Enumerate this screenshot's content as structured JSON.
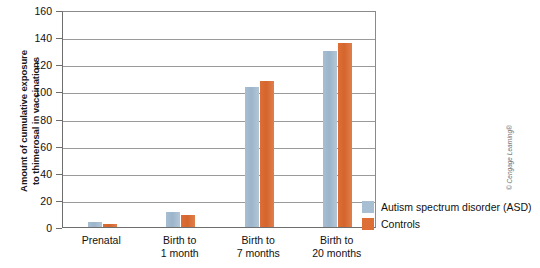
{
  "chart_data": {
    "type": "bar",
    "title": "",
    "xlabel": "",
    "ylabel": "Amount of cumulative exposure to thimerosal in vaccinations",
    "ylabel_lines": [
      "Amount of cumulative exposure",
      "to thimerosal in vaccinations"
    ],
    "ylim": [
      0,
      160
    ],
    "yticks": [
      0,
      20,
      40,
      60,
      80,
      100,
      120,
      140,
      160
    ],
    "ytick_labels": [
      "0",
      "20",
      "40",
      "60",
      "80",
      "100",
      "120",
      "140",
      "160"
    ],
    "grid": true,
    "legend_position": "right",
    "categories": [
      "Prenatal",
      "Birth to 1 month",
      "Birth to 7 months",
      "Birth to 20 months"
    ],
    "category_lines": [
      [
        "Prenatal"
      ],
      [
        "Birth to",
        "1 month"
      ],
      [
        "Birth to",
        "7 months"
      ],
      [
        "Birth to",
        "20 months"
      ]
    ],
    "series": [
      {
        "name": "Autism spectrum disorder (ASD)",
        "color": "#a8bed2",
        "values": [
          4,
          11,
          103,
          130
        ]
      },
      {
        "name": "Controls",
        "color": "#dd6f36",
        "values": [
          2,
          9,
          108,
          136
        ]
      }
    ]
  },
  "credit": "© Cengage Learning®"
}
